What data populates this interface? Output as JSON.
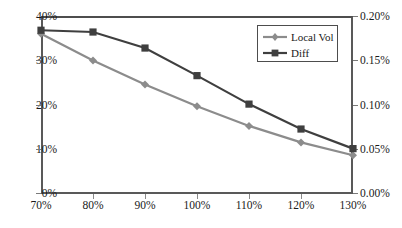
{
  "chart_data": {
    "type": "line",
    "title": "",
    "xlabel": "",
    "ylabel": "",
    "categories": [
      "70%",
      "80%",
      "90%",
      "100%",
      "110%",
      "120%",
      "130%"
    ],
    "series": [
      {
        "name": "Local Vol",
        "axis": "left",
        "color": "#8c8c8c",
        "marker": "diamond",
        "values": [
          36.0,
          30.0,
          24.6,
          19.7,
          15.3,
          11.6,
          8.7
        ]
      },
      {
        "name": "Diff",
        "axis": "right",
        "color": "#3f3f3f",
        "marker": "square",
        "values": [
          0.184,
          0.182,
          0.164,
          0.133,
          0.101,
          0.073,
          0.051
        ]
      }
    ],
    "left_axis": {
      "ticks": [
        "0%",
        "10%",
        "20%",
        "30%",
        "40%"
      ],
      "values": [
        0,
        10,
        20,
        30,
        40
      ],
      "ylim": [
        0,
        40
      ]
    },
    "right_axis": {
      "ticks": [
        "0.00%",
        "0.05%",
        "0.10%",
        "0.15%",
        "0.20%"
      ],
      "values": [
        0,
        0.05,
        0.1,
        0.15,
        0.2
      ],
      "ylim": [
        0,
        0.2
      ]
    },
    "grid": false,
    "legend_position": "top-right"
  },
  "legend": {
    "items": [
      {
        "label": "Local Vol"
      },
      {
        "label": "Diff"
      }
    ]
  }
}
